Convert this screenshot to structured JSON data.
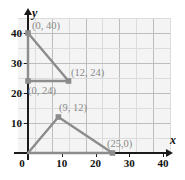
{
  "chart_data": {
    "type": "line",
    "title": "",
    "xlabel": "x",
    "ylabel": "y",
    "xlim": [
      0,
      45
    ],
    "ylim": [
      0,
      45
    ],
    "grid": true,
    "grid_major_step": 10,
    "grid_minor_step": 5,
    "legend": "none",
    "xticks": [
      0,
      10,
      20,
      30,
      40
    ],
    "xticklabels": [
      "0",
      "10",
      "20",
      "30",
      "40"
    ],
    "yticks": [
      10,
      20,
      30,
      40
    ],
    "yticklabels": [
      "10",
      "20",
      "30",
      "40"
    ],
    "series": [
      {
        "name": "upper-triangle",
        "points": [
          [
            0,
            40
          ],
          [
            12,
            24
          ],
          [
            0,
            24
          ]
        ],
        "closed": true,
        "color": "#8c8c8c"
      },
      {
        "name": "lower-triangle",
        "points": [
          [
            0,
            0
          ],
          [
            9,
            12
          ],
          [
            25,
            0
          ]
        ],
        "closed": true,
        "color": "#8c8c8c"
      }
    ],
    "markers": [
      {
        "point": [
          0,
          40
        ],
        "label": "(0, 40)"
      },
      {
        "point": [
          12,
          24
        ],
        "label": "(12, 24)"
      },
      {
        "point": [
          0,
          24
        ],
        "label": "(0, 24)"
      },
      {
        "point": [
          9,
          12
        ],
        "label": "(9, 12)"
      },
      {
        "point": [
          25,
          0
        ],
        "label": "(25,0)"
      }
    ],
    "annotations": [
      {
        "name": "label-0-40",
        "text": "(0, 40)"
      },
      {
        "name": "label-12-24",
        "text": "(12, 24)"
      },
      {
        "name": "label-0-24",
        "text": "(0, 24)"
      },
      {
        "name": "label-9-12",
        "text": "(9, 12)"
      },
      {
        "name": "label-25-0",
        "text": "(25,0)"
      }
    ],
    "colors": {
      "line": "#8c8c8c",
      "marker": "#8c8c8c",
      "axis": "#1a1a1a",
      "grid_major": "#bdbdbd",
      "grid_minor": "#dcdcdc",
      "plot_background": "#f4f4f4",
      "annotation_text": "#8a8a8a",
      "tick_text": "#111111"
    }
  },
  "axes": {
    "x_name": "x",
    "y_name": "y"
  }
}
